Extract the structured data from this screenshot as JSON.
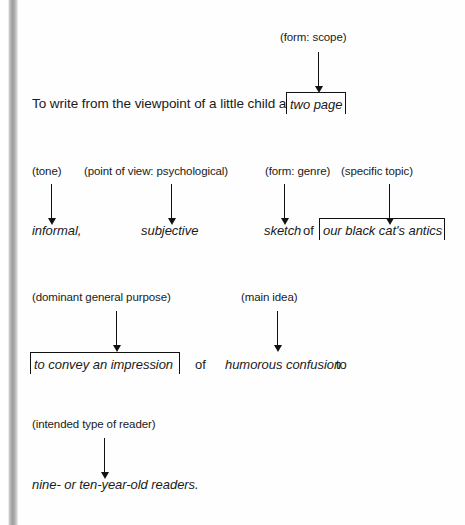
{
  "figure": {
    "kind": "annotated-thesis-statement-diagram"
  },
  "colors": {
    "ink": "#111111",
    "paper": "#fefefe",
    "binding_shadow": "#9e9e9e"
  },
  "rows": [
    {
      "id": "row-1",
      "labels": [
        {
          "id": "label-form-scope",
          "text": "(form: scope)"
        }
      ],
      "sentence": [
        {
          "id": "lead-clause",
          "text": "To write from the viewpoint of a little child a",
          "style": "roman"
        },
        {
          "id": "frag-two-page",
          "text": "two page",
          "style": "italic",
          "boxed": true
        }
      ]
    },
    {
      "id": "row-2",
      "labels": [
        {
          "id": "label-tone",
          "text": "(tone)"
        },
        {
          "id": "label-point-of-view",
          "text": "(point of view: psychological)"
        },
        {
          "id": "label-form-genre",
          "text": "(form: genre)"
        },
        {
          "id": "label-specific-topic",
          "text": "(specific topic)"
        }
      ],
      "sentence": [
        {
          "id": "frag-informal",
          "text": "informal,",
          "style": "italic",
          "boxed": false
        },
        {
          "id": "frag-subjective",
          "text": "subjective",
          "style": "italic",
          "boxed": false
        },
        {
          "id": "frag-sketch",
          "text": "sketch",
          "style": "italic",
          "boxed": false
        },
        {
          "id": "connector-of-1",
          "text": "of",
          "style": "roman"
        },
        {
          "id": "frag-cat-antics",
          "text": "our black cat's antics",
          "style": "italic",
          "boxed": true
        }
      ]
    },
    {
      "id": "row-3",
      "labels": [
        {
          "id": "label-dominant-purpose",
          "text": "(dominant general purpose)"
        },
        {
          "id": "label-main-idea",
          "text": "(main idea)"
        }
      ],
      "sentence": [
        {
          "id": "frag-convey-impression",
          "text": "to convey an impression",
          "style": "italic",
          "boxed": true
        },
        {
          "id": "connector-of-2",
          "text": "of",
          "style": "roman"
        },
        {
          "id": "frag-humorous-confusion",
          "text": "humorous confusion",
          "style": "italic",
          "boxed": false
        },
        {
          "id": "connector-to",
          "text": "to",
          "style": "roman"
        }
      ]
    },
    {
      "id": "row-4",
      "labels": [
        {
          "id": "label-intended-reader",
          "text": "(intended type of reader)"
        }
      ],
      "sentence": [
        {
          "id": "frag-nine-ten-readers",
          "text": "nine- or ten-year-old readers.",
          "style": "italic",
          "boxed": false
        }
      ]
    }
  ],
  "arrows": [
    {
      "id": "arrow-form-scope",
      "points_from": "(form: scope)",
      "points_to": "two page"
    },
    {
      "id": "arrow-tone",
      "points_from": "(tone)",
      "points_to": "informal,"
    },
    {
      "id": "arrow-point-of-view",
      "points_from": "(point of view: psychological)",
      "points_to": "subjective"
    },
    {
      "id": "arrow-form-genre",
      "points_from": "(form: genre)",
      "points_to": "sketch"
    },
    {
      "id": "arrow-specific-topic",
      "points_from": "(specific topic)",
      "points_to": "our black cat's antics"
    },
    {
      "id": "arrow-dominant-purpose",
      "points_from": "(dominant general purpose)",
      "points_to": "to convey an impression"
    },
    {
      "id": "arrow-main-idea",
      "points_from": "(main idea)",
      "points_to": "humorous confusion"
    },
    {
      "id": "arrow-intended-reader",
      "points_from": "(intended type of reader)",
      "points_to": "nine- or ten-year-old readers."
    }
  ]
}
